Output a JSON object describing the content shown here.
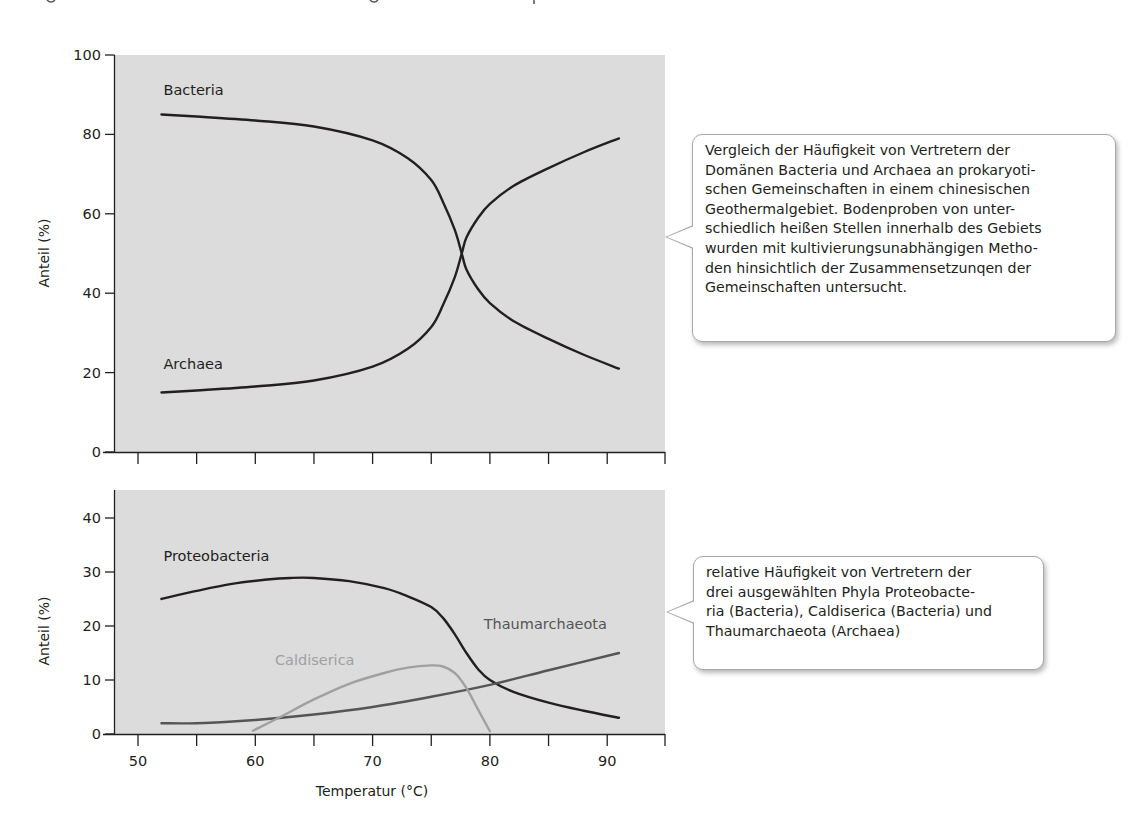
{
  "colors": {
    "plot_background": "#dcdcdc",
    "axis": "#231f20",
    "text": "#231f20",
    "series_dark": "#231f20",
    "series_medium": "#555555",
    "series_light": "#a0a0a0",
    "callout_border": "#a8a8a8"
  },
  "callouts": {
    "top": "Vergleich der Häufigkeit von Vertretern der\nDomänen Bacteria und Archaea an prokaryoti-\nschen Gemeinschaften in einem chinesischen\nGeothermalgebiet. Bodenproben von unter-\nschiedlich heißen Stellen innerhalb des Gebiets\nwurden mit kultivierungsunabhängigen Metho-\nden hinsichtlich der Zusammensetzunqen der\nGemeinschaften untersucht.",
    "bottom": "relative Häufigkeit von Vertretern der\ndrei ausgewählten Phyla Proteobacte-\nria (Bacteria), Caldiserica (Bacteria) und\nThaumarchaeota (Archaea)"
  },
  "chart_data": [
    {
      "type": "line",
      "title": "",
      "xlabel": "",
      "ylabel": "Anteil (%)",
      "xlim": [
        47,
        95
      ],
      "ylim": [
        0,
        100
      ],
      "yticks": [
        0,
        20,
        40,
        60,
        80,
        100
      ],
      "xticks_unlabeled": [
        50,
        55,
        60,
        65,
        70,
        75,
        80,
        85,
        90,
        95
      ],
      "grid": false,
      "legend": "inline labels",
      "series": [
        {
          "name": "Bacteria",
          "color": "#231f20",
          "label_pos": [
            52,
            90
          ],
          "x": [
            52,
            55,
            60,
            65,
            70,
            73,
            75,
            76,
            77,
            77.6,
            78,
            79,
            80,
            82,
            85,
            88,
            91
          ],
          "y": [
            85,
            84.5,
            83.5,
            82,
            78.5,
            74,
            68.5,
            63,
            56,
            50,
            46,
            41,
            37.5,
            33,
            28.5,
            24.5,
            21
          ]
        },
        {
          "name": "Archaea",
          "color": "#231f20",
          "label_pos": [
            52,
            21
          ],
          "x": [
            52,
            55,
            60,
            65,
            70,
            73,
            75,
            76,
            77,
            77.6,
            78,
            79,
            80,
            82,
            85,
            88,
            91
          ],
          "y": [
            15,
            15.5,
            16.5,
            18,
            21.5,
            26,
            31.5,
            37,
            44,
            50,
            54,
            59,
            62.5,
            67,
            71.5,
            75.5,
            79
          ]
        }
      ]
    },
    {
      "type": "line",
      "title": "",
      "xlabel": "Temperatur (°C)",
      "ylabel": "Anteil (%)",
      "xlim": [
        47,
        95
      ],
      "ylim": [
        0,
        45
      ],
      "xticks": [
        50,
        60,
        70,
        80,
        90
      ],
      "xticks_minor": [
        55,
        65,
        75,
        85,
        95
      ],
      "yticks": [
        0,
        10,
        20,
        30,
        40
      ],
      "grid": false,
      "legend": "inline labels",
      "series": [
        {
          "name": "Proteobacteria",
          "color": "#231f20",
          "label_pos": [
            52,
            32
          ],
          "x": [
            52,
            55,
            58,
            61,
            63,
            65,
            68,
            71,
            73,
            75,
            76,
            77,
            78,
            79,
            80,
            82,
            85,
            88,
            91
          ],
          "y": [
            25,
            26.5,
            27.8,
            28.6,
            28.9,
            28.9,
            28.3,
            27,
            25.5,
            23.5,
            21.5,
            18.5,
            15,
            12,
            10,
            7.8,
            5.8,
            4.3,
            3
          ]
        },
        {
          "name": "Thaumarchaeota",
          "color": "#555555",
          "label_pos": [
            79.3,
            19.5
          ],
          "x": [
            52,
            55,
            60,
            65,
            70,
            75,
            80,
            85,
            91
          ],
          "y": [
            2,
            2,
            2.6,
            3.6,
            5,
            6.9,
            9.1,
            11.8,
            15
          ]
        },
        {
          "name": "Caldiserica",
          "color": "#a0a0a0",
          "label_pos": [
            61.5,
            12.8
          ],
          "x": [
            59.8,
            62,
            65,
            68,
            71,
            73,
            75,
            76,
            77,
            78,
            79,
            80
          ],
          "y": [
            0.6,
            3,
            6.4,
            9.3,
            11.3,
            12.3,
            12.7,
            12.5,
            11.3,
            8.5,
            4.5,
            0.5
          ]
        }
      ]
    }
  ]
}
